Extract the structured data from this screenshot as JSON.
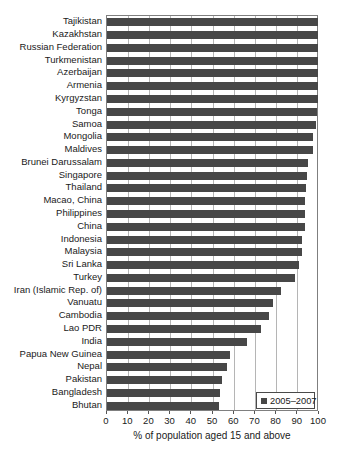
{
  "chart_data": {
    "type": "bar",
    "orientation": "horizontal",
    "title": "",
    "xlabel": "% of population aged 15 and above",
    "xlim": [
      0,
      100
    ],
    "xticks": [
      0,
      10,
      20,
      30,
      40,
      50,
      60,
      70,
      80,
      90,
      100
    ],
    "grid": "vertical",
    "legend": {
      "label": "2005–2007",
      "position": "bottom-right"
    },
    "categories": [
      "Tajikistan",
      "Kazakhstan",
      "Russian Federation",
      "Turkmenistan",
      "Azerbaijan",
      "Armenia",
      "Kyrgyzstan",
      "Tonga",
      "Samoa",
      "Mongolia",
      "Maldives",
      "Brunei Darussalam",
      "Singapore",
      "Thailand",
      "Macao, China",
      "Philippines",
      "China",
      "Indonesia",
      "Malaysia",
      "Sri Lanka",
      "Turkey",
      "Iran (Islamic Rep. of)",
      "Vanuatu",
      "Cambodia",
      "Lao PDR",
      "India",
      "Papua New Guinea",
      "Nepal",
      "Pakistan",
      "Bangladesh",
      "Bhutan"
    ],
    "values": [
      99.6,
      99.6,
      99.5,
      99.5,
      99.5,
      99.5,
      99.3,
      99.2,
      98.7,
      97.3,
      97.0,
      94.9,
      94.4,
      94.1,
      93.5,
      93.4,
      93.3,
      92.0,
      91.9,
      90.8,
      88.7,
      82.3,
      78.1,
      76.3,
      72.7,
      66.0,
      57.8,
      56.5,
      54.2,
      53.5,
      52.8
    ]
  },
  "colors": {
    "bar": "#474747",
    "gridline": "#b5b5b5",
    "plot_border": "#7f7f7f",
    "text": "#1a1a1a",
    "background": "#ffffff"
  }
}
